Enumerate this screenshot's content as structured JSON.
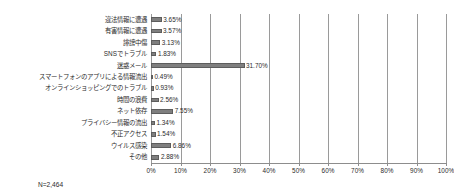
{
  "footnote": "N=2,464",
  "chart_data": {
    "type": "bar",
    "orientation": "horizontal",
    "title": "",
    "xlabel": "",
    "ylabel": "",
    "xlim": [
      0,
      100
    ],
    "grid": true,
    "legend": false,
    "unit": "%",
    "tick_labels": [
      "0%",
      "10%",
      "20%",
      "30%",
      "40%",
      "50%",
      "60%",
      "70%",
      "80%",
      "90%",
      "100%"
    ],
    "tick_values": [
      0,
      10,
      20,
      30,
      40,
      50,
      60,
      70,
      80,
      90,
      100
    ],
    "categories": [
      "違法情報に遭遇",
      "有害情報に遭遇",
      "誹謗中傷",
      "SNSでトラブル",
      "迷惑メール",
      "スマートフォンのアプリによる情報流出",
      "オンラインショッピングでのトラブル",
      "時間の浪費",
      "ネット依存",
      "プライバシー情報の流出",
      "不正アクセス",
      "ウイルス感染",
      "その他"
    ],
    "values": [
      3.65,
      3.57,
      3.13,
      1.83,
      31.7,
      0.49,
      0.93,
      2.56,
      7.55,
      1.34,
      1.54,
      6.86,
      2.88
    ],
    "value_labels": [
      "3.65%",
      "3.57%",
      "3.13%",
      "1.83%",
      "31.70%",
      "0.49%",
      "0.93%",
      "2.56%",
      "7.55%",
      "1.34%",
      "1.54%",
      "6.86%",
      "2.88%"
    ],
    "bar_color": "#7f7f7f",
    "grid_color": "#9a9a9a"
  }
}
